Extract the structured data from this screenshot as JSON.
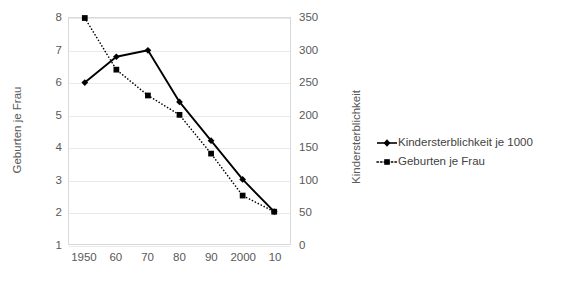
{
  "chart_data": {
    "type": "line",
    "title": "",
    "xlabel": "",
    "categories": [
      "1950",
      "60",
      "70",
      "80",
      "90",
      "2000",
      "10"
    ],
    "grid": true,
    "legend_position": "right",
    "axes": {
      "left": {
        "label": "Geburten je Frau",
        "ticks": [
          "8",
          "7",
          "6",
          "5",
          "4",
          "3",
          "2",
          "1"
        ],
        "min": 1,
        "max": 8,
        "step": 1
      },
      "right": {
        "label": "Kindersterblichkeit",
        "ticks": [
          "350",
          "300",
          "250",
          "200",
          "150",
          "100",
          "50",
          "0"
        ],
        "min": 0,
        "max": 350,
        "step": 50
      }
    },
    "series": [
      {
        "name": "Kindersterblichkeit je 1000",
        "axis": "right",
        "style": "solid",
        "marker": "diamond",
        "color": "#000000",
        "values": [
          250,
          290,
          300,
          220,
          160,
          100,
          50
        ]
      },
      {
        "name": "Geburten je Frau",
        "axis": "left",
        "style": "dotted",
        "marker": "square",
        "color": "#000000",
        "values": [
          8.0,
          6.4,
          5.6,
          5.0,
          3.8,
          2.5,
          2.0
        ]
      }
    ]
  },
  "legend": {
    "items": [
      {
        "label": "Kindersterblichkeit je 1000"
      },
      {
        "label": "Geburten je Frau"
      }
    ]
  }
}
